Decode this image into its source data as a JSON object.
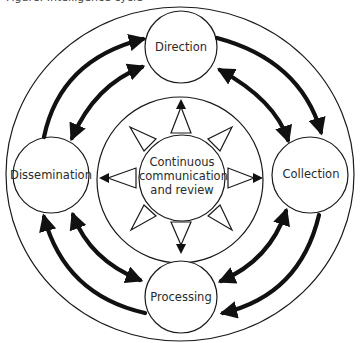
{
  "caption": {
    "text": "Figure: Intelligence cycle"
  },
  "center": {
    "lines": [
      "Continuous",
      "communication",
      "and review"
    ]
  },
  "nodes": {
    "top": "Direction",
    "right": "Collection",
    "bottom": "Processing",
    "left": "Dissemination"
  },
  "flows": [
    {
      "from": "Direction",
      "to": "Collection",
      "outer": "one-way",
      "inner": "two-way"
    },
    {
      "from": "Collection",
      "to": "Processing",
      "outer": "one-way",
      "inner": "two-way"
    },
    {
      "from": "Processing",
      "to": "Dissemination",
      "outer": "one-way",
      "inner": "two-way"
    },
    {
      "from": "Dissemination",
      "to": "Direction",
      "outer": "one-way",
      "inner": "two-way"
    }
  ],
  "colors": {
    "stroke": "#1a1a1a",
    "text": "#2a2a2a",
    "background": "#ffffff"
  }
}
